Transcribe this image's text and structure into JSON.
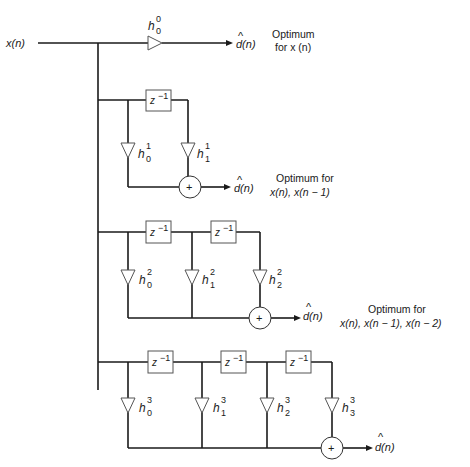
{
  "diagram": {
    "input_label": "x(n)",
    "output_label": "d(n)",
    "output_hat": "^",
    "delay_label": "z",
    "delay_exp": "−1",
    "sum_symbol": "+",
    "stages": [
      {
        "order": 0,
        "coefficients": [
          {
            "base": "h",
            "sup": "0",
            "sub": "0"
          }
        ],
        "delays": 0,
        "note_lines": [
          "Optimum",
          "for x (n)"
        ]
      },
      {
        "order": 1,
        "coefficients": [
          {
            "base": "h",
            "sup": "1",
            "sub": "0"
          },
          {
            "base": "h",
            "sup": "1",
            "sub": "1"
          }
        ],
        "delays": 1,
        "note_lines": [
          "Optimum for",
          "x(n), x(n − 1)"
        ]
      },
      {
        "order": 2,
        "coefficients": [
          {
            "base": "h",
            "sup": "2",
            "sub": "0"
          },
          {
            "base": "h",
            "sup": "2",
            "sub": "1"
          },
          {
            "base": "h",
            "sup": "2",
            "sub": "2"
          }
        ],
        "delays": 2,
        "note_lines": [
          "Optimum for",
          "x(n), x(n − 1), x(n − 2)"
        ]
      },
      {
        "order": 3,
        "coefficients": [
          {
            "base": "h",
            "sup": "3",
            "sub": "0"
          },
          {
            "base": "h",
            "sup": "3",
            "sub": "1"
          },
          {
            "base": "h",
            "sup": "3",
            "sub": "2"
          },
          {
            "base": "h",
            "sup": "3",
            "sub": "3"
          }
        ],
        "delays": 3,
        "note_lines": []
      }
    ]
  }
}
